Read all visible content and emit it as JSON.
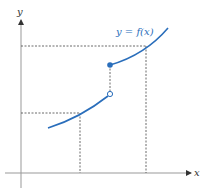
{
  "diagram": {
    "type": "piecewise-function-jump-discontinuity",
    "axes": {
      "x_label": "x",
      "y_label": "y"
    },
    "curve_label": "y = f(x)",
    "colors": {
      "curve": "#2a6ebb",
      "axis": "#808080",
      "dashed": "#333333",
      "label": "#2a6ebb"
    },
    "points": {
      "open_circle": "open endpoint of lower branch",
      "filled_dot": "closed endpoint of upper branch"
    }
  }
}
